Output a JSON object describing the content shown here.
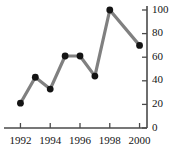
{
  "chart_data": {
    "type": "line",
    "title": "",
    "subtitle": "",
    "xlabel": "",
    "ylabel": "",
    "x": [
      1992,
      1993,
      1994,
      1995,
      1996,
      1997,
      1998,
      2000
    ],
    "values": [
      21,
      43,
      33,
      61,
      61,
      44,
      100,
      70
    ],
    "series": [
      {
        "name": "",
        "x": [
          1992,
          1993,
          1994,
          1995,
          1996,
          1997,
          1998,
          2000
        ],
        "values": [
          21,
          43,
          33,
          61,
          61,
          44,
          100,
          70
        ]
      }
    ],
    "xlim": [
      1991.5,
      2000.5
    ],
    "ylim": [
      0,
      100
    ],
    "xticks": [
      1992,
      1994,
      1996,
      1998,
      2000
    ],
    "xtick_labels": [
      "1992",
      "1994",
      "1996",
      "1998",
      "2000"
    ],
    "yticks": [
      0,
      20,
      40,
      60,
      80,
      100
    ],
    "ytick_labels": [
      "0",
      "20",
      "40",
      "60",
      "80",
      "100"
    ],
    "y_axis_position": "right",
    "grid": false,
    "legend": null,
    "legend_position": "none",
    "annotations": [],
    "colors": {
      "line": "#808080",
      "marker": "#141414",
      "axis": "#4a4a4a",
      "text": "#141414",
      "background": "#ffffff"
    },
    "style": {
      "line_width": 3.2,
      "marker": "circle",
      "marker_radius": 3.4
    }
  }
}
